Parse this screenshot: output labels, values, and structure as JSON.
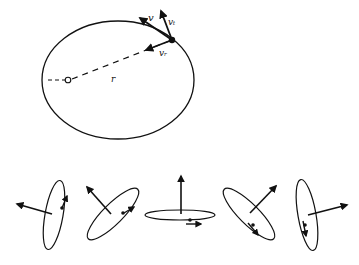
{
  "figure": {
    "top": {
      "description": "Elliptical orbit with position vector and velocity decomposition",
      "labels": {
        "velocity": "v",
        "tangential": "vₜ",
        "radial": "vᵣ",
        "radius": "r"
      }
    },
    "bottom": {
      "description": "Sequence of orbit orientations viewed at different inclinations with angular momentum vectors",
      "panels": [
        {
          "id": "orientation-1"
        },
        {
          "id": "orientation-2"
        },
        {
          "id": "orientation-3"
        },
        {
          "id": "orientation-4"
        },
        {
          "id": "orientation-5"
        }
      ]
    },
    "colors": {
      "ink": "#111111",
      "background": "#ffffff"
    }
  }
}
